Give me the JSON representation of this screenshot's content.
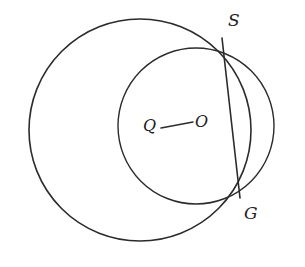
{
  "figure": {
    "type": "geometry-diagram",
    "background_color": "#ffffff",
    "stroke_color": "#2b2b2b",
    "label_color": "#222222",
    "width": 305,
    "height": 267
  },
  "shapes": {
    "large_circle": {
      "name": "circle-Q",
      "center_label": "Q",
      "cx": 140,
      "cy": 130,
      "r": 111,
      "stroke": "#2b2b2b",
      "stroke_width": 1.6
    },
    "medium_circle": {
      "name": "circle-O",
      "center_label": "O",
      "cx": 196,
      "cy": 126,
      "r": 78,
      "stroke": "#2b2b2b",
      "stroke_width": 1.4
    }
  },
  "points": {
    "S": {
      "label": "S",
      "x": 222,
      "y": 38,
      "label_x": 228,
      "label_y": 12
    },
    "G": {
      "label": "G",
      "x": 240,
      "y": 198,
      "label_x": 244,
      "label_y": 205
    },
    "Q": {
      "label": "Q",
      "x": 150,
      "y": 128,
      "label_x": 143,
      "label_y": 118
    },
    "O": {
      "label": "O",
      "x": 202,
      "y": 123,
      "label_x": 195,
      "label_y": 114
    }
  },
  "segments": {
    "chord_SG": {
      "name": "chord-S-G",
      "from": "S",
      "to": "G",
      "x1": 222,
      "y1": 38,
      "x2": 240,
      "y2": 198,
      "stroke": "#2b2b2b",
      "stroke_width": 1.6
    },
    "segment_QO": {
      "name": "segment-Q-O",
      "from": "Q",
      "to": "O",
      "x1": 161,
      "y1": 128,
      "x2": 193,
      "y2": 122,
      "stroke": "#2b2b2b",
      "stroke_width": 1.5
    }
  }
}
